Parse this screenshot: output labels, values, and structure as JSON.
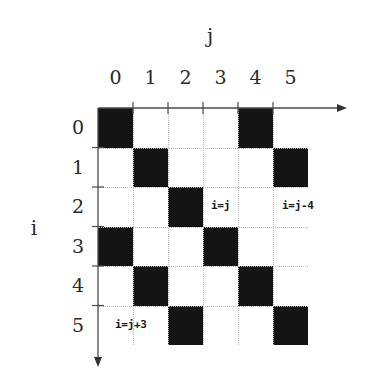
{
  "figure": {
    "title": "",
    "x_axis_title": "j",
    "y_axis_title": "i",
    "column_labels": [
      "0",
      "1",
      "2",
      "3",
      "4",
      "5"
    ],
    "row_labels": [
      "0",
      "1",
      "2",
      "3",
      "4",
      "5"
    ],
    "annotations": [
      {
        "id": "main-diagonal",
        "text": "i=j"
      },
      {
        "id": "upper-diagonal",
        "text": "i=j-4"
      },
      {
        "id": "lower-diagonal",
        "text": "i=j+3"
      }
    ],
    "colors": {
      "filled_cell": "#141414",
      "empty_cell": "#ffffff",
      "gridline": "#b9b9b9",
      "axis": "#4a4a4a",
      "text": "#2a2a2a"
    }
  },
  "chart_data": {
    "type": "heatmap",
    "title": "",
    "xlabel": "j",
    "ylabel": "i",
    "x": [
      0,
      1,
      2,
      3,
      4,
      5
    ],
    "y": [
      0,
      1,
      2,
      3,
      4,
      5
    ],
    "xtick_labels": [
      "0",
      "1",
      "2",
      "3",
      "4",
      "5"
    ],
    "ytick_labels": [
      "0",
      "1",
      "2",
      "3",
      "4",
      "5"
    ],
    "xlim": [
      0,
      6
    ],
    "ylim": [
      0,
      6
    ],
    "grid": true,
    "legend": null,
    "values": [
      [
        1,
        0,
        0,
        0,
        1,
        0
      ],
      [
        0,
        1,
        0,
        0,
        0,
        1
      ],
      [
        0,
        0,
        1,
        0,
        0,
        0
      ],
      [
        1,
        0,
        0,
        1,
        0,
        0
      ],
      [
        0,
        1,
        0,
        0,
        1,
        0
      ],
      [
        0,
        0,
        1,
        0,
        0,
        1
      ]
    ],
    "filled_coordinates": [
      [
        0,
        0
      ],
      [
        0,
        4
      ],
      [
        1,
        1
      ],
      [
        1,
        5
      ],
      [
        2,
        2
      ],
      [
        3,
        0
      ],
      [
        3,
        3
      ],
      [
        4,
        1
      ],
      [
        4,
        4
      ],
      [
        5,
        2
      ],
      [
        5,
        5
      ]
    ],
    "diagonals": [
      {
        "label": "i=j",
        "offset": 0
      },
      {
        "label": "i=j-4",
        "offset": -4
      },
      {
        "label": "i=j+3",
        "offset": 3
      }
    ],
    "annotations": [
      {
        "text": "i=j",
        "x": 3.2,
        "y": 2.3
      },
      {
        "text": "i=j-4",
        "x": 5.2,
        "y": 2.3
      },
      {
        "text": "i=j+3",
        "x": 0.5,
        "y": 5.3
      }
    ]
  }
}
